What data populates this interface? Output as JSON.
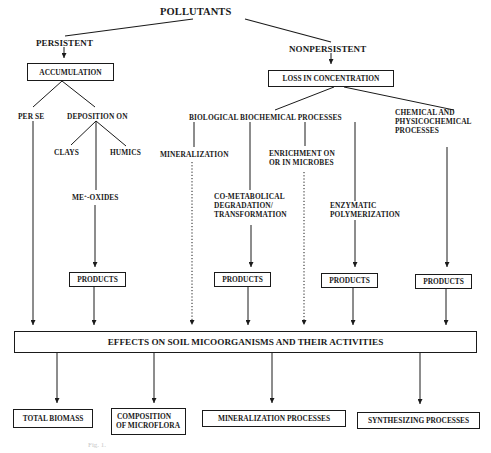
{
  "diagram": {
    "root": "POLLUTANTS",
    "persistent": {
      "label": "PERSISTENT",
      "box": "ACCUMULATION",
      "per_se": "PER SE",
      "deposition": "DEPOSITION ON",
      "clays": "CLAYS",
      "humics": "HUMICS",
      "oxides_prefix": "ME",
      "oxides_sup": "+",
      "oxides_suffix": "-OXIDES",
      "products": "PRODUCTS"
    },
    "nonpersistent": {
      "label": "NONPERSISTENT",
      "box": "LOSS IN CONCENTRATION",
      "biological": "BIOLOGICAL BIOCHEMICAL PROCESSES",
      "chemical": [
        "CHEMICAL AND",
        "PHYSICOCHEMICAL",
        "PROCESSES"
      ],
      "mineralization": "MINERALIZATION",
      "enrichment": [
        "ENRICHMENT ON",
        "OR IN MICROBES"
      ],
      "cometabolical": [
        "CO-METABOLICAL",
        "DEGRADATION/",
        "TRANSFORMATION"
      ],
      "enzymatic": [
        "ENZYMATIC",
        "POLYMERIZATION"
      ],
      "products": [
        "PRODUCTS",
        "PRODUCTS",
        "PRODUCTS"
      ]
    },
    "effects": "EFFECTS ON SOIL MICOORGANISMS AND THEIR ACTIVITIES",
    "outcomes": [
      "TOTAL BIOMASS",
      [
        "COMPOSITION",
        "OF MICROFLORA"
      ],
      "MINERALIZATION PROCESSES",
      "SYNTHESIZING PROCESSES"
    ],
    "caption": "Fig. 1."
  }
}
